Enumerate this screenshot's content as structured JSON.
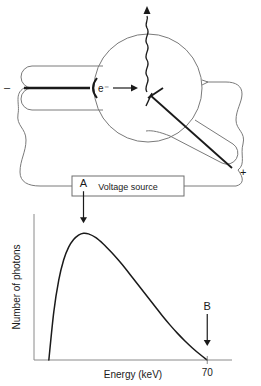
{
  "figure": {
    "title": "",
    "top_diagram": {
      "name": "x-ray-tube-diagram",
      "labels": {
        "electron_label": "e⁻",
        "cathode_sign": "–",
        "anode_sign": "+",
        "voltage_source": "Voltage source"
      },
      "parts": {
        "cathode_name": "cathode",
        "anode_name": "anode-target",
        "tube_envelope_name": "evacuated-tube",
        "xray_beam_name": "xray-photon-beam",
        "electron_beam_name": "electron-beam",
        "circuit_name": "high-voltage-circuit"
      },
      "colors": {
        "outline": "#6e6e6e",
        "beam": "#1a1a1a",
        "text": "#1a1a1a",
        "box_fill": "#ffffff"
      }
    },
    "bottom_chart": {
      "name": "bremsstrahlung-spectrum-chart"
    }
  },
  "chart_data": {
    "type": "line",
    "title": "",
    "xlabel": "Energy (keV)",
    "ylabel": "Number of photons",
    "xlim": [
      0,
      80
    ],
    "ylim": [
      0,
      1.12
    ],
    "grid": false,
    "legend": null,
    "xticks": [
      70
    ],
    "xticklabels": [
      "70"
    ],
    "yticks": [],
    "yticklabels": [],
    "annotations": [
      {
        "label": "A",
        "meaning": "peak-of-continuous-spectrum",
        "x": 20,
        "y": 1.0,
        "arrow": "down"
      },
      {
        "label": "B",
        "meaning": "maximum-photon-energy-cutoff",
        "x": 70,
        "y": 0.0,
        "arrow": "down"
      }
    ],
    "series": [
      {
        "name": "continuous bremsstrahlung spectrum",
        "x": [
          6,
          8,
          10,
          12,
          14,
          16,
          18,
          20,
          22,
          25,
          28,
          31,
          34,
          37,
          40,
          43,
          46,
          49,
          52,
          55,
          58,
          61,
          64,
          67,
          70
        ],
        "y": [
          0.0,
          0.38,
          0.63,
          0.79,
          0.89,
          0.95,
          0.985,
          1.0,
          0.995,
          0.965,
          0.915,
          0.855,
          0.79,
          0.72,
          0.645,
          0.57,
          0.495,
          0.42,
          0.345,
          0.275,
          0.21,
          0.15,
          0.095,
          0.045,
          0.0
        ]
      }
    ]
  }
}
